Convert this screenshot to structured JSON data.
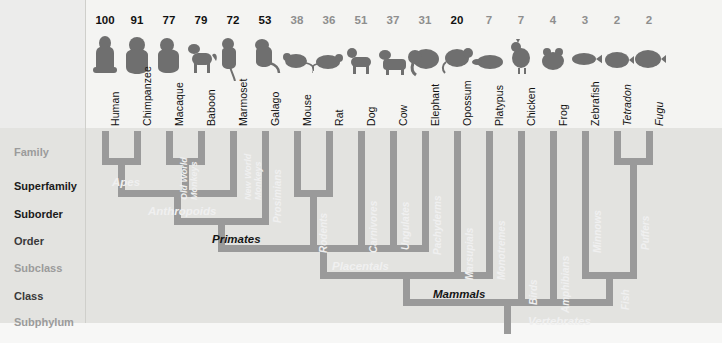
{
  "diagram": {
    "type": "phylogenetic-tree",
    "orientation": "tips-top",
    "colors": {
      "branch": "#9a9a9a",
      "branch_dark": "#848484",
      "background": "#e3e3e0",
      "background_top": "#f4f4f2",
      "text_dark": "#111111",
      "text_gray": "#8e8e8e",
      "clade_light": "#f0f0f0"
    }
  },
  "ranks": [
    {
      "label": "Family",
      "emphasis": "gray",
      "y": 146
    },
    {
      "label": "Superfamily",
      "emphasis": "bold",
      "y": 180
    },
    {
      "label": "Suborder",
      "emphasis": "bold",
      "y": 208
    },
    {
      "label": "Order",
      "emphasis": "norm",
      "y": 235
    },
    {
      "label": "Subclass",
      "emphasis": "gray",
      "y": 262
    },
    {
      "label": "Class",
      "emphasis": "norm",
      "y": 290
    },
    {
      "label": "Subphylum",
      "emphasis": "gray",
      "y": 316
    }
  ],
  "species": [
    {
      "name": "Human",
      "score": "100",
      "score_style": "dark",
      "x": 105,
      "icon": "human-icon",
      "italic": false
    },
    {
      "name": "Chimpanzee",
      "score": "91",
      "score_style": "dark",
      "x": 137,
      "icon": "chimpanzee-icon",
      "italic": false
    },
    {
      "name": "Macaque",
      "score": "77",
      "score_style": "dark",
      "x": 169,
      "icon": "macaque-icon",
      "italic": false
    },
    {
      "name": "Baboon",
      "score": "79",
      "score_style": "dark",
      "x": 201,
      "icon": "baboon-icon",
      "italic": false
    },
    {
      "name": "Marmoset",
      "score": "72",
      "score_style": "dark",
      "x": 233,
      "icon": "marmoset-icon",
      "italic": false
    },
    {
      "name": "Galago",
      "score": "53",
      "score_style": "dark",
      "x": 265,
      "icon": "galago-icon",
      "italic": false
    },
    {
      "name": "Mouse",
      "score": "38",
      "score_style": "gray",
      "x": 297,
      "icon": "mouse-icon",
      "italic": false
    },
    {
      "name": "Rat",
      "score": "36",
      "score_style": "gray",
      "x": 329,
      "icon": "rat-icon",
      "italic": false
    },
    {
      "name": "Dog",
      "score": "51",
      "score_style": "gray",
      "x": 361,
      "icon": "dog-icon",
      "italic": false
    },
    {
      "name": "Cow",
      "score": "37",
      "score_style": "gray",
      "x": 393,
      "icon": "cow-icon",
      "italic": false
    },
    {
      "name": "Elephant",
      "score": "31",
      "score_style": "gray",
      "x": 425,
      "icon": "elephant-icon",
      "italic": false
    },
    {
      "name": "Opossum",
      "score": "20",
      "score_style": "dark",
      "x": 457,
      "icon": "opossum-icon",
      "italic": false
    },
    {
      "name": "Platypus",
      "score": "7",
      "score_style": "gray",
      "x": 489,
      "icon": "platypus-icon",
      "italic": false
    },
    {
      "name": "Chicken",
      "score": "7",
      "score_style": "gray",
      "x": 521,
      "icon": "chicken-icon",
      "italic": false
    },
    {
      "name": "Frog",
      "score": "4",
      "score_style": "gray",
      "x": 553,
      "icon": "frog-icon",
      "italic": false
    },
    {
      "name": "Zebrafish",
      "score": "3",
      "score_style": "gray",
      "x": 585,
      "icon": "zebrafish-icon",
      "italic": false
    },
    {
      "name": "Tetradon",
      "score": "2",
      "score_style": "gray",
      "x": 617,
      "icon": "tetradon-icon",
      "italic": true
    },
    {
      "name": "Fugu",
      "score": "2",
      "score_style": "gray",
      "x": 649,
      "icon": "fugu-icon",
      "italic": true
    }
  ],
  "clades": [
    {
      "label": "Apes",
      "style": "light",
      "orient": "h",
      "x": 112,
      "y": 176
    },
    {
      "label": "Old World",
      "label2": "Monkeys",
      "style": "light",
      "orient": "v2",
      "x": 180,
      "y": 200
    },
    {
      "label": "New World",
      "label2": "Monkeys",
      "style": "light",
      "orient": "v2",
      "x": 244,
      "y": 200
    },
    {
      "label": "Prosimians",
      "style": "light",
      "orient": "v",
      "x": 272,
      "y": 223
    },
    {
      "label": "Anthropoids",
      "style": "light",
      "orient": "h",
      "x": 148,
      "y": 205
    },
    {
      "label": "Primates",
      "style": "dark",
      "orient": "h",
      "x": 212,
      "y": 233
    },
    {
      "label": "Rodents",
      "style": "light",
      "orient": "v",
      "x": 318,
      "y": 253
    },
    {
      "label": "Carnivores",
      "style": "light",
      "orient": "v",
      "x": 368,
      "y": 253
    },
    {
      "label": "Ungulates",
      "style": "light",
      "orient": "v",
      "x": 400,
      "y": 250
    },
    {
      "label": "Pachyderms",
      "style": "light",
      "orient": "v",
      "x": 432,
      "y": 255
    },
    {
      "label": "Marsupials",
      "style": "light",
      "orient": "v",
      "x": 464,
      "y": 280
    },
    {
      "label": "Monotremes",
      "style": "light",
      "orient": "v",
      "x": 496,
      "y": 280
    },
    {
      "label": "Birds",
      "style": "light",
      "orient": "v",
      "x": 528,
      "y": 305
    },
    {
      "label": "Amphibians",
      "style": "light",
      "orient": "v",
      "x": 560,
      "y": 313
    },
    {
      "label": "Minnows",
      "style": "light",
      "orient": "v",
      "x": 592,
      "y": 253
    },
    {
      "label": "Puffers",
      "style": "light",
      "orient": "v",
      "x": 640,
      "y": 250
    },
    {
      "label": "Fish",
      "style": "light",
      "orient": "v",
      "x": 620,
      "y": 310
    },
    {
      "label": "Placentals",
      "style": "light",
      "orient": "h",
      "x": 332,
      "y": 260
    },
    {
      "label": "Mammals",
      "style": "dark",
      "orient": "h",
      "x": 433,
      "y": 288
    },
    {
      "label": "Vertebrates",
      "style": "light",
      "orient": "h",
      "x": 528,
      "y": 315
    }
  ]
}
